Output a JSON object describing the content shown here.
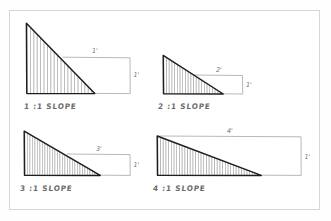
{
  "sheet": {
    "title": "Slope Ratio Reference Sketch",
    "background_color": "#fefefe",
    "frame_color": "#d7d7d7",
    "ink_color": "#1d1d1d",
    "hatch_color": "#6d6d6d",
    "dimension_color": "#8e8e8e"
  },
  "diagram": {
    "type": "hand-drawn-engineering-sketch",
    "unit_symbol": "'",
    "figure_count": 4
  },
  "figures": [
    {
      "id": "slope-1-1",
      "label": "1 :1 SLOPE",
      "ratio_run": 1,
      "ratio_rise": 1,
      "run_dimension": "1'",
      "rise_dimension": "1'",
      "hatch_count": 20,
      "grid_position": "top-left"
    },
    {
      "id": "slope-2-1",
      "label": "2 :1 SLOPE",
      "ratio_run": 2,
      "ratio_rise": 1,
      "run_dimension": "2'",
      "rise_dimension": "1'",
      "hatch_count": 22,
      "grid_position": "top-right"
    },
    {
      "id": "slope-3-1",
      "label": "3 :1 SLOPE",
      "ratio_run": 3,
      "ratio_rise": 1,
      "run_dimension": "3'",
      "rise_dimension": "1'",
      "hatch_count": 30,
      "grid_position": "bottom-left"
    },
    {
      "id": "slope-4-1",
      "label": "4 :1 SLOPE",
      "ratio_run": 4,
      "ratio_rise": 1,
      "run_dimension": "4'",
      "rise_dimension": "1'",
      "hatch_count": 38,
      "grid_position": "bottom-right"
    }
  ]
}
